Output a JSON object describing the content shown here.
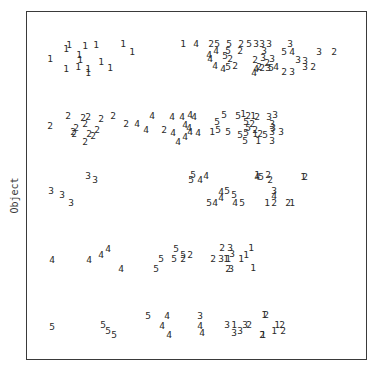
{
  "chart_data": {
    "type": "scatter",
    "title": "",
    "xlabel": "(partially cut off at bottom edge)",
    "ylabel": "Object",
    "grid": false,
    "legend": null,
    "marker_style": "digit labels 1-5 used as plot symbols",
    "rows": [
      "1",
      "2",
      "3",
      "4",
      "5"
    ],
    "points": [
      {
        "row": 1,
        "label": "1",
        "x": 50,
        "y": 59
      },
      {
        "row": 1,
        "label": "1",
        "x": 66,
        "y": 49
      },
      {
        "row": 1,
        "label": "1",
        "x": 69,
        "y": 45
      },
      {
        "row": 1,
        "label": "1",
        "x": 85,
        "y": 46
      },
      {
        "row": 1,
        "label": "1",
        "x": 96,
        "y": 45
      },
      {
        "row": 1,
        "label": "1",
        "x": 123,
        "y": 44
      },
      {
        "row": 1,
        "label": "1",
        "x": 132,
        "y": 52
      },
      {
        "row": 1,
        "label": "1",
        "x": 79,
        "y": 55
      },
      {
        "row": 1,
        "label": "1",
        "x": 80,
        "y": 60
      },
      {
        "row": 1,
        "label": "1",
        "x": 66,
        "y": 69
      },
      {
        "row": 1,
        "label": "1",
        "x": 78,
        "y": 67
      },
      {
        "row": 1,
        "label": "1",
        "x": 88,
        "y": 69
      },
      {
        "row": 1,
        "label": "1",
        "x": 88,
        "y": 73
      },
      {
        "row": 1,
        "label": "1",
        "x": 101,
        "y": 62
      },
      {
        "row": 1,
        "label": "1",
        "x": 110,
        "y": 68
      },
      {
        "row": 1,
        "label": "1",
        "x": 183,
        "y": 44
      },
      {
        "row": 1,
        "label": "4",
        "x": 196,
        "y": 44
      },
      {
        "row": 1,
        "label": "2",
        "x": 211,
        "y": 44
      },
      {
        "row": 1,
        "label": "5",
        "x": 217,
        "y": 44
      },
      {
        "row": 1,
        "label": "5",
        "x": 229,
        "y": 44
      },
      {
        "row": 1,
        "label": "2",
        "x": 241,
        "y": 44
      },
      {
        "row": 1,
        "label": "5",
        "x": 249,
        "y": 44
      },
      {
        "row": 1,
        "label": "3",
        "x": 256,
        "y": 44
      },
      {
        "row": 1,
        "label": "3",
        "x": 262,
        "y": 44
      },
      {
        "row": 1,
        "label": "3",
        "x": 269,
        "y": 44
      },
      {
        "row": 1,
        "label": "3",
        "x": 290,
        "y": 44
      },
      {
        "row": 1,
        "label": "4",
        "x": 216,
        "y": 51
      },
      {
        "row": 1,
        "label": "5",
        "x": 228,
        "y": 51
      },
      {
        "row": 1,
        "label": "2",
        "x": 240,
        "y": 51
      },
      {
        "row": 1,
        "label": "3",
        "x": 264,
        "y": 51
      },
      {
        "row": 1,
        "label": "5",
        "x": 284,
        "y": 52
      },
      {
        "row": 1,
        "label": "4",
        "x": 292,
        "y": 52
      },
      {
        "row": 1,
        "label": "3",
        "x": 319,
        "y": 52
      },
      {
        "row": 1,
        "label": "2",
        "x": 334,
        "y": 52
      },
      {
        "row": 1,
        "label": "4",
        "x": 209,
        "y": 55
      },
      {
        "row": 1,
        "label": "4",
        "x": 210,
        "y": 59
      },
      {
        "row": 1,
        "label": "5",
        "x": 225,
        "y": 56
      },
      {
        "row": 1,
        "label": "2",
        "x": 230,
        "y": 59
      },
      {
        "row": 1,
        "label": "2",
        "x": 255,
        "y": 60
      },
      {
        "row": 1,
        "label": "3",
        "x": 263,
        "y": 58
      },
      {
        "row": 1,
        "label": "3",
        "x": 272,
        "y": 59
      },
      {
        "row": 1,
        "label": "2",
        "x": 267,
        "y": 63
      },
      {
        "row": 1,
        "label": "3",
        "x": 298,
        "y": 60
      },
      {
        "row": 1,
        "label": "3",
        "x": 305,
        "y": 61
      },
      {
        "row": 1,
        "label": "4",
        "x": 215,
        "y": 66
      },
      {
        "row": 1,
        "label": "4",
        "x": 223,
        "y": 69
      },
      {
        "row": 1,
        "label": "5",
        "x": 228,
        "y": 67
      },
      {
        "row": 1,
        "label": "2",
        "x": 235,
        "y": 66
      },
      {
        "row": 1,
        "label": "4",
        "x": 256,
        "y": 69
      },
      {
        "row": 1,
        "label": "2",
        "x": 259,
        "y": 67
      },
      {
        "row": 1,
        "label": "2",
        "x": 262,
        "y": 68
      },
      {
        "row": 1,
        "label": "3",
        "x": 268,
        "y": 68
      },
      {
        "row": 1,
        "label": "5",
        "x": 271,
        "y": 68
      },
      {
        "row": 1,
        "label": "4",
        "x": 276,
        "y": 67
      },
      {
        "row": 1,
        "label": "2",
        "x": 284,
        "y": 72
      },
      {
        "row": 1,
        "label": "3",
        "x": 292,
        "y": 72
      },
      {
        "row": 1,
        "label": "3",
        "x": 305,
        "y": 67
      },
      {
        "row": 1,
        "label": "2",
        "x": 313,
        "y": 67
      },
      {
        "row": 1,
        "label": "4",
        "x": 254,
        "y": 73
      },
      {
        "row": 2,
        "label": "2",
        "x": 50,
        "y": 126
      },
      {
        "row": 2,
        "label": "2",
        "x": 68,
        "y": 116
      },
      {
        "row": 2,
        "label": "2",
        "x": 83,
        "y": 118
      },
      {
        "row": 2,
        "label": "2",
        "x": 88,
        "y": 117
      },
      {
        "row": 2,
        "label": "2",
        "x": 101,
        "y": 119
      },
      {
        "row": 2,
        "label": "2",
        "x": 113,
        "y": 116
      },
      {
        "row": 2,
        "label": "2",
        "x": 85,
        "y": 124
      },
      {
        "row": 2,
        "label": "2",
        "x": 73,
        "y": 132
      },
      {
        "row": 2,
        "label": "2",
        "x": 76,
        "y": 128
      },
      {
        "row": 2,
        "label": "2",
        "x": 74,
        "y": 134
      },
      {
        "row": 2,
        "label": "2",
        "x": 89,
        "y": 134
      },
      {
        "row": 2,
        "label": "2",
        "x": 93,
        "y": 136
      },
      {
        "row": 2,
        "label": "2",
        "x": 97,
        "y": 130
      },
      {
        "row": 2,
        "label": "2",
        "x": 85,
        "y": 142
      },
      {
        "row": 2,
        "label": "2",
        "x": 126,
        "y": 124
      },
      {
        "row": 2,
        "label": "4",
        "x": 137,
        "y": 124
      },
      {
        "row": 2,
        "label": "4",
        "x": 152,
        "y": 116
      },
      {
        "row": 2,
        "label": "4",
        "x": 146,
        "y": 130
      },
      {
        "row": 2,
        "label": "2",
        "x": 164,
        "y": 130
      },
      {
        "row": 2,
        "label": "4",
        "x": 172,
        "y": 117
      },
      {
        "row": 2,
        "label": "4",
        "x": 182,
        "y": 117
      },
      {
        "row": 2,
        "label": "4",
        "x": 190,
        "y": 115
      },
      {
        "row": 2,
        "label": "4",
        "x": 194,
        "y": 117
      },
      {
        "row": 2,
        "label": "4",
        "x": 185,
        "y": 125
      },
      {
        "row": 2,
        "label": "4",
        "x": 189,
        "y": 128
      },
      {
        "row": 2,
        "label": "4",
        "x": 173,
        "y": 133
      },
      {
        "row": 2,
        "label": "4",
        "x": 190,
        "y": 132
      },
      {
        "row": 2,
        "label": "4",
        "x": 198,
        "y": 133
      },
      {
        "row": 2,
        "label": "4",
        "x": 178,
        "y": 142
      },
      {
        "row": 2,
        "label": "4",
        "x": 185,
        "y": 137
      },
      {
        "row": 2,
        "label": "1",
        "x": 212,
        "y": 132
      },
      {
        "row": 2,
        "label": "5",
        "x": 218,
        "y": 130
      },
      {
        "row": 2,
        "label": "5",
        "x": 217,
        "y": 122
      },
      {
        "row": 2,
        "label": "5",
        "x": 224,
        "y": 115
      },
      {
        "row": 2,
        "label": "5",
        "x": 228,
        "y": 132
      },
      {
        "row": 2,
        "label": "5",
        "x": 238,
        "y": 116
      },
      {
        "row": 2,
        "label": "1",
        "x": 243,
        "y": 114
      },
      {
        "row": 2,
        "label": "2",
        "x": 248,
        "y": 116
      },
      {
        "row": 2,
        "label": "1",
        "x": 253,
        "y": 116
      },
      {
        "row": 2,
        "label": "2",
        "x": 257,
        "y": 117
      },
      {
        "row": 2,
        "label": "3",
        "x": 269,
        "y": 117
      },
      {
        "row": 2,
        "label": "3",
        "x": 275,
        "y": 115
      },
      {
        "row": 2,
        "label": "5",
        "x": 246,
        "y": 122
      },
      {
        "row": 2,
        "label": "2",
        "x": 252,
        "y": 124
      },
      {
        "row": 2,
        "label": "3",
        "x": 272,
        "y": 124
      },
      {
        "row": 2,
        "label": "5",
        "x": 248,
        "y": 128
      },
      {
        "row": 2,
        "label": "2",
        "x": 255,
        "y": 130
      },
      {
        "row": 2,
        "label": "3",
        "x": 273,
        "y": 128
      },
      {
        "row": 2,
        "label": "5",
        "x": 240,
        "y": 135
      },
      {
        "row": 2,
        "label": "5",
        "x": 246,
        "y": 133
      },
      {
        "row": 2,
        "label": "1",
        "x": 255,
        "y": 134
      },
      {
        "row": 2,
        "label": "2",
        "x": 260,
        "y": 134
      },
      {
        "row": 2,
        "label": "5",
        "x": 265,
        "y": 135
      },
      {
        "row": 2,
        "label": "3",
        "x": 272,
        "y": 132
      },
      {
        "row": 2,
        "label": "3",
        "x": 281,
        "y": 132
      },
      {
        "row": 2,
        "label": "5",
        "x": 245,
        "y": 141
      },
      {
        "row": 2,
        "label": "1",
        "x": 258,
        "y": 141
      },
      {
        "row": 2,
        "label": "3",
        "x": 272,
        "y": 141
      },
      {
        "row": 3,
        "label": "3",
        "x": 88,
        "y": 176
      },
      {
        "row": 3,
        "label": "3",
        "x": 95,
        "y": 180
      },
      {
        "row": 3,
        "label": "3",
        "x": 51,
        "y": 191
      },
      {
        "row": 3,
        "label": "3",
        "x": 62,
        "y": 195
      },
      {
        "row": 3,
        "label": "3",
        "x": 71,
        "y": 203
      },
      {
        "row": 3,
        "label": "5",
        "x": 193,
        "y": 175
      },
      {
        "row": 3,
        "label": "5",
        "x": 191,
        "y": 180
      },
      {
        "row": 3,
        "label": "4",
        "x": 200,
        "y": 180
      },
      {
        "row": 3,
        "label": "4",
        "x": 206,
        "y": 176
      },
      {
        "row": 3,
        "label": "1",
        "x": 257,
        "y": 175
      },
      {
        "row": 3,
        "label": "4",
        "x": 257,
        "y": 177
      },
      {
        "row": 3,
        "label": "5",
        "x": 261,
        "y": 177
      },
      {
        "row": 3,
        "label": "2",
        "x": 268,
        "y": 175
      },
      {
        "row": 3,
        "label": "2",
        "x": 270,
        "y": 180
      },
      {
        "row": 3,
        "label": "1",
        "x": 303,
        "y": 177
      },
      {
        "row": 3,
        "label": "2",
        "x": 305,
        "y": 177
      },
      {
        "row": 3,
        "label": "4",
        "x": 221,
        "y": 192
      },
      {
        "row": 3,
        "label": "5",
        "x": 227,
        "y": 191
      },
      {
        "row": 3,
        "label": "5",
        "x": 234,
        "y": 195
      },
      {
        "row": 3,
        "label": "4",
        "x": 221,
        "y": 198
      },
      {
        "row": 3,
        "label": "3",
        "x": 274,
        "y": 191
      },
      {
        "row": 3,
        "label": "4",
        "x": 274,
        "y": 196
      },
      {
        "row": 3,
        "label": "5",
        "x": 209,
        "y": 203
      },
      {
        "row": 3,
        "label": "4",
        "x": 215,
        "y": 203
      },
      {
        "row": 3,
        "label": "4",
        "x": 235,
        "y": 203
      },
      {
        "row": 3,
        "label": "5",
        "x": 242,
        "y": 203
      },
      {
        "row": 3,
        "label": "1",
        "x": 267,
        "y": 203
      },
      {
        "row": 3,
        "label": "2",
        "x": 274,
        "y": 203
      },
      {
        "row": 3,
        "label": "2",
        "x": 288,
        "y": 203
      },
      {
        "row": 3,
        "label": "1",
        "x": 292,
        "y": 203
      },
      {
        "row": 4,
        "label": "4",
        "x": 52,
        "y": 260
      },
      {
        "row": 4,
        "label": "4",
        "x": 89,
        "y": 260
      },
      {
        "row": 4,
        "label": "4",
        "x": 101,
        "y": 255
      },
      {
        "row": 4,
        "label": "4",
        "x": 108,
        "y": 249
      },
      {
        "row": 4,
        "label": "4",
        "x": 121,
        "y": 269
      },
      {
        "row": 4,
        "label": "5",
        "x": 156,
        "y": 269
      },
      {
        "row": 4,
        "label": "5",
        "x": 161,
        "y": 259
      },
      {
        "row": 4,
        "label": "5",
        "x": 176,
        "y": 249
      },
      {
        "row": 4,
        "label": "5",
        "x": 174,
        "y": 259
      },
      {
        "row": 4,
        "label": "5",
        "x": 183,
        "y": 255
      },
      {
        "row": 4,
        "label": "2",
        "x": 183,
        "y": 259
      },
      {
        "row": 4,
        "label": "2",
        "x": 190,
        "y": 255
      },
      {
        "row": 4,
        "label": "2",
        "x": 213,
        "y": 259
      },
      {
        "row": 4,
        "label": "2",
        "x": 222,
        "y": 248
      },
      {
        "row": 4,
        "label": "3",
        "x": 230,
        "y": 248
      },
      {
        "row": 4,
        "label": "3",
        "x": 221,
        "y": 259
      },
      {
        "row": 4,
        "label": "1",
        "x": 226,
        "y": 259
      },
      {
        "row": 4,
        "label": "3",
        "x": 232,
        "y": 254
      },
      {
        "row": 4,
        "label": "1",
        "x": 228,
        "y": 259
      },
      {
        "row": 4,
        "label": "2",
        "x": 228,
        "y": 269
      },
      {
        "row": 4,
        "label": "3",
        "x": 231,
        "y": 269
      },
      {
        "row": 4,
        "label": "1",
        "x": 241,
        "y": 259
      },
      {
        "row": 4,
        "label": "1",
        "x": 246,
        "y": 255
      },
      {
        "row": 4,
        "label": "1",
        "x": 251,
        "y": 248
      },
      {
        "row": 4,
        "label": "1",
        "x": 253,
        "y": 268
      },
      {
        "row": 5,
        "label": "5",
        "x": 52,
        "y": 327
      },
      {
        "row": 5,
        "label": "5",
        "x": 103,
        "y": 325
      },
      {
        "row": 5,
        "label": "5",
        "x": 108,
        "y": 331
      },
      {
        "row": 5,
        "label": "5",
        "x": 114,
        "y": 335
      },
      {
        "row": 5,
        "label": "5",
        "x": 148,
        "y": 316
      },
      {
        "row": 5,
        "label": "4",
        "x": 167,
        "y": 316
      },
      {
        "row": 5,
        "label": "4",
        "x": 162,
        "y": 326
      },
      {
        "row": 5,
        "label": "4",
        "x": 169,
        "y": 335
      },
      {
        "row": 5,
        "label": "3",
        "x": 200,
        "y": 316
      },
      {
        "row": 5,
        "label": "4",
        "x": 200,
        "y": 326
      },
      {
        "row": 5,
        "label": "4",
        "x": 202,
        "y": 333
      },
      {
        "row": 5,
        "label": "3",
        "x": 227,
        "y": 325
      },
      {
        "row": 5,
        "label": "1",
        "x": 234,
        "y": 325
      },
      {
        "row": 5,
        "label": "3",
        "x": 234,
        "y": 333
      },
      {
        "row": 5,
        "label": "3",
        "x": 240,
        "y": 331
      },
      {
        "row": 5,
        "label": "3",
        "x": 245,
        "y": 325
      },
      {
        "row": 5,
        "label": "2",
        "x": 249,
        "y": 325
      },
      {
        "row": 5,
        "label": "1",
        "x": 264,
        "y": 315
      },
      {
        "row": 5,
        "label": "2",
        "x": 266,
        "y": 315
      },
      {
        "row": 5,
        "label": "2",
        "x": 262,
        "y": 335
      },
      {
        "row": 5,
        "label": "1",
        "x": 263,
        "y": 335
      },
      {
        "row": 5,
        "label": "1",
        "x": 277,
        "y": 325
      },
      {
        "row": 5,
        "label": "2",
        "x": 282,
        "y": 325
      },
      {
        "row": 5,
        "label": "1",
        "x": 274,
        "y": 331
      },
      {
        "row": 5,
        "label": "2",
        "x": 283,
        "y": 331
      }
    ]
  },
  "axes": {
    "ylabel": "Object",
    "xlabel": ""
  }
}
